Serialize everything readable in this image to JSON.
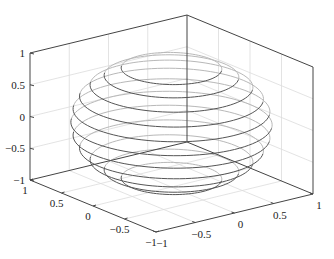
{
  "chart_data": {
    "type": "line",
    "subtype": "3d-wireframe-sphere",
    "title": "",
    "xlabel": "",
    "ylabel": "",
    "zlabel": "",
    "xlim": [
      -1,
      1
    ],
    "ylim": [
      -1,
      1
    ],
    "zlim": [
      -1,
      1
    ],
    "grid": true,
    "legend": null,
    "x_ticks": [
      -1,
      -0.5,
      0,
      0.5,
      1
    ],
    "x_tick_labels": [
      "−1",
      "−0.5",
      "0",
      "0.5",
      "1"
    ],
    "y_ticks": [
      -1,
      -0.5,
      0,
      0.5,
      1
    ],
    "y_tick_labels": [
      "−1",
      "−0.5",
      "0",
      "0.5",
      "1"
    ],
    "z_ticks": [
      -1,
      -0.5,
      0,
      0.5,
      1
    ],
    "z_tick_labels": [
      "−1",
      "−0.5",
      "0",
      "0.5",
      "1"
    ],
    "surface": {
      "shape": "unit sphere",
      "rendering": "horizontal latitude rings",
      "ring_latitudes_deg": [
        -60,
        -48,
        -36,
        -24,
        -12,
        0,
        12,
        24,
        36,
        48,
        60
      ],
      "ring_z": [
        -0.866,
        -0.743,
        -0.588,
        -0.407,
        -0.208,
        0,
        0.208,
        0.407,
        0.588,
        0.743,
        0.866
      ],
      "ring_radius": [
        0.5,
        0.669,
        0.809,
        0.914,
        0.978,
        1,
        0.978,
        0.914,
        0.809,
        0.669,
        0.5
      ]
    },
    "colors": {
      "ring_front": "#555555",
      "ring_back": "#b8b8b8",
      "axis": "#444444",
      "grid": "#dcdcdc"
    }
  }
}
